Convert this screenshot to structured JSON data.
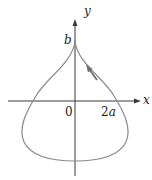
{
  "figure": {
    "type": "parametric-curve-teardrop",
    "axes": {
      "x_label": "x",
      "y_label": "y"
    },
    "labels": {
      "origin": "0",
      "x_tick": "2a",
      "x_tick_coef": "2",
      "x_tick_var": "a",
      "y_tick": "b"
    },
    "curve": {
      "description": "closed teardrop-shaped curve with a cusp at (0, b) on the y-axis, crossing the x-axis near x = 2a, traversed counterclockwise (arrow on right branch pointing up toward cusp)",
      "direction_arrow": "up-left along right branch"
    },
    "colors": {
      "curve": "#8a8a8a",
      "axes": "#3a3a3a",
      "arrow": "#6d6e71",
      "text": "#231f20"
    }
  }
}
